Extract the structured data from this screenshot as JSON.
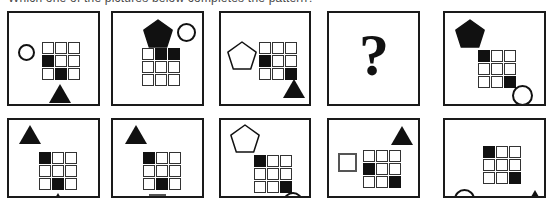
{
  "header": {
    "clipped_caption": "Which one of the pictures below completes the pattern?"
  },
  "puzzle": {
    "grid_size": 3,
    "rows": [
      {
        "name": "matrix-row",
        "panels": [
          {
            "id": "panel-1",
            "label": "1",
            "x": 7,
            "width": 93,
            "grid": {
              "x": 33,
              "y": 29,
              "filled": [
                [
                  1,
                  0
                ],
                [
                  2,
                  1
                ]
              ]
            },
            "shapes": [
              {
                "type": "circle",
                "fill": "white",
                "x": 9,
                "y": 31,
                "size": 17
              },
              {
                "type": "triangle",
                "fill": "black",
                "x": 40,
                "y": 71
              }
            ]
          },
          {
            "id": "panel-2",
            "label": "2",
            "x": 111,
            "width": 93,
            "grid": {
              "x": 29,
              "y": 35,
              "filled": [
                [
                  0,
                  1
                ],
                [
                  0,
                  2
                ]
              ]
            },
            "shapes": [
              {
                "type": "pentagon",
                "fill": "black",
                "x": 30,
                "y": 6
              },
              {
                "type": "circle",
                "fill": "white",
                "x": 64,
                "y": 10,
                "size": 19
              }
            ]
          },
          {
            "id": "panel-3",
            "label": "3",
            "x": 219,
            "width": 92,
            "grid": {
              "x": 38,
              "y": 29,
              "filled": [
                [
                  1,
                  0
                ],
                [
                  2,
                  2
                ]
              ]
            },
            "shapes": [
              {
                "type": "pentagon",
                "fill": "white",
                "x": 6,
                "y": 28
              },
              {
                "type": "triangle",
                "fill": "black",
                "x": 62,
                "y": 66
              }
            ]
          },
          {
            "id": "panel-4",
            "label": "4",
            "x": 327,
            "width": 93,
            "grid": null,
            "shapes": [],
            "question_mark": "?"
          },
          {
            "id": "panel-5",
            "label": "5",
            "x": 443,
            "width": 103,
            "grid": {
              "x": 33,
              "y": 37,
              "filled": [
                [
                  0,
                  0
                ],
                [
                  2,
                  2
                ]
              ]
            },
            "shapes": [
              {
                "type": "pentagon",
                "fill": "black",
                "x": 10,
                "y": 6
              },
              {
                "type": "circle",
                "fill": "white",
                "x": 67,
                "y": 72,
                "size": 21
              }
            ]
          }
        ]
      },
      {
        "name": "answer-options-row",
        "panels": [
          {
            "id": "option-1",
            "label": "1",
            "x": 7,
            "width": 93,
            "grid": {
              "x": 30,
              "y": 32,
              "filled": [
                [
                  0,
                  0
                ],
                [
                  2,
                  1
                ]
              ]
            },
            "shapes": [
              {
                "type": "triangle",
                "fill": "black",
                "x": 10,
                "y": 5
              },
              {
                "type": "triangle",
                "fill": "black",
                "x": 38,
                "y": 73
              }
            ]
          },
          {
            "id": "option-2",
            "label": "2",
            "x": 111,
            "width": 93,
            "grid": {
              "x": 30,
              "y": 32,
              "filled": [
                [
                  0,
                  0
                ],
                [
                  2,
                  1
                ]
              ]
            },
            "shapes": [
              {
                "type": "triangle",
                "fill": "black",
                "x": 12,
                "y": 5
              },
              {
                "type": "square",
                "fill": "white",
                "x": 36,
                "y": 74,
                "size": 17
              }
            ]
          },
          {
            "id": "option-3",
            "label": "3",
            "x": 219,
            "width": 92,
            "grid": {
              "x": 33,
              "y": 35,
              "filled": [
                [
                  0,
                  0
                ],
                [
                  2,
                  2
                ]
              ]
            },
            "shapes": [
              {
                "type": "pentagon",
                "fill": "white",
                "x": 9,
                "y": 4
              },
              {
                "type": "circle",
                "fill": "white",
                "x": 62,
                "y": 72,
                "size": 20
              }
            ]
          },
          {
            "id": "option-4",
            "label": "4",
            "x": 327,
            "width": 93,
            "grid": {
              "x": 34,
              "y": 30,
              "filled": [
                [
                  1,
                  0
                ],
                [
                  2,
                  2
                ]
              ]
            },
            "shapes": [
              {
                "type": "triangle",
                "fill": "black",
                "x": 62,
                "y": 6
              },
              {
                "type": "square",
                "fill": "white",
                "x": 9,
                "y": 33,
                "size": 19
              }
            ]
          },
          {
            "id": "option-5",
            "label": "5",
            "x": 443,
            "width": 103,
            "grid": {
              "x": 38,
              "y": 26,
              "filled": [
                [
                  0,
                  0
                ],
                [
                  2,
                  2
                ]
              ]
            },
            "shapes": [
              {
                "type": "circle",
                "fill": "white",
                "x": 9,
                "y": 69,
                "size": 21
              },
              {
                "type": "triangle",
                "fill": "black",
                "x": 79,
                "y": 70
              }
            ]
          }
        ]
      }
    ]
  },
  "colors": {
    "ink": "#111111",
    "panel_border": "#1a1a1a",
    "cell_border": "#333333",
    "background": "#ffffff"
  }
}
